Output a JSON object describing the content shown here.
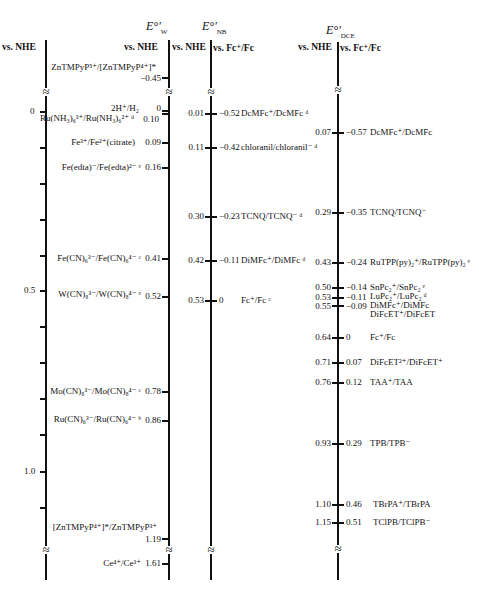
{
  "headers": {
    "axis1": "vs. NHE",
    "ew_title": "E°′",
    "ew_sub": "W",
    "ew_left": "vs. NHE",
    "enb_title": "E°′",
    "enb_sub": "NB",
    "enb_left": "vs. NHE",
    "enb_right": "vs. Fc⁺/Fc",
    "edce_title": "E°′",
    "edce_sub": "DCE",
    "edce_left": "vs. NHE",
    "edce_right": "vs. Fc⁺/Fc"
  },
  "axis1_ticks": [
    {
      "label": "0",
      "y": 111
    },
    {
      "label": "0.5",
      "y": 290
    },
    {
      "label": "1.0",
      "y": 471
    }
  ],
  "water": [
    {
      "couple": "ZnTMPyP⁵⁺/[ZnTMPyP⁴⁺]*",
      "value": "−0.45"
    },
    {
      "couple": "2H⁺/H₂",
      "value": "0"
    },
    {
      "couple": "Ru(NH₃)₆³⁺/Ru(NH₃)₆²⁺ ᵈ",
      "value": "0.10"
    },
    {
      "couple": "Fe³⁺/Fe²⁺(citrate)",
      "value": "0.09"
    },
    {
      "couple": "Fe(edta)⁻/Fe(edta)²⁻ ᵉ",
      "value": "0.16"
    },
    {
      "couple": "Fe(CN)₆³⁻/Fe(CN)₆⁴⁻ ᶜ",
      "value": "0.41"
    },
    {
      "couple": "W(CN)₈³⁻/W(CN)₈⁴⁻ ᵉ",
      "value": "0.52"
    },
    {
      "couple": "Mo(CN)₈³⁻/Mo(CN)₈⁴⁻ ᶜ",
      "value": "0.78"
    },
    {
      "couple": "Ru(CN)₆³⁻/Ru(CN)₆⁴⁻ ᵇ",
      "value": "0.86"
    },
    {
      "couple": "[ZnTMPyP⁴⁺]*/ZnTMPyP³⁺",
      "value": "1.19"
    },
    {
      "couple": "Ce⁴⁺/Ce³⁺",
      "value": "1.61"
    }
  ],
  "nb": [
    {
      "nhe": "0.01",
      "fc": "−0.52",
      "couple": "DcMFc⁺/DcMFc ᵈ"
    },
    {
      "nhe": "0.11",
      "fc": "−0.42",
      "couple": "chloranil/chloranil⁻ ᵈ"
    },
    {
      "nhe": "0.30",
      "fc": "−0.23",
      "couple": "TCNQ/TCNQ⁻ ᵈ"
    },
    {
      "nhe": "0.42",
      "fc": "−0.11",
      "couple": "DiMFc⁺/DiMFc ᵈ"
    },
    {
      "nhe": "0.53",
      "fc": "0",
      "couple": "Fc⁺/Fc ᶜ"
    }
  ],
  "dce": [
    {
      "nhe": "0.07",
      "fc": "−0.57",
      "couple": "DcMFc⁺/DcMFc"
    },
    {
      "nhe": "0.29",
      "fc": "−0.35",
      "couple": "TCNQ/TCNQ⁻"
    },
    {
      "nhe": "0.43",
      "fc": "−0.24",
      "couple": "RuTPP(py)₂⁺/RuTPP(py)₂ ᵉ"
    },
    {
      "nhe": "0.50",
      "fc": "−0.14",
      "couple": "SnPc₂⁺/SnPc₂ ᵉ"
    },
    {
      "nhe": "0.53",
      "fc": "−0.11",
      "couple": "LuPc₂⁺/LuPc₂ ᵈ"
    },
    {
      "nhe": "0.55",
      "fc": "−0.09",
      "couple": "DiMFc⁺/DiMFc"
    },
    {
      "nhe": "",
      "fc": "",
      "couple": "DiFcET⁺/DiFcET"
    },
    {
      "nhe": "0.64",
      "fc": "0",
      "couple": "Fc⁺/Fc"
    },
    {
      "nhe": "0.71",
      "fc": "0.07",
      "couple": "DiFcET²⁺/DiFcET⁺"
    },
    {
      "nhe": "0.76",
      "fc": "0.12",
      "couple": "TAA⁺/TAA"
    },
    {
      "nhe": "0.93",
      "fc": "0.29",
      "couple": "TPB/TPB⁻"
    },
    {
      "nhe": "1.10",
      "fc": "0.46",
      "couple": "TBrPA⁺/TBrPA"
    },
    {
      "nhe": "1.15",
      "fc": "0.51",
      "couple": "TClPB/TClPB⁻"
    }
  ],
  "break_symbol": "≈"
}
